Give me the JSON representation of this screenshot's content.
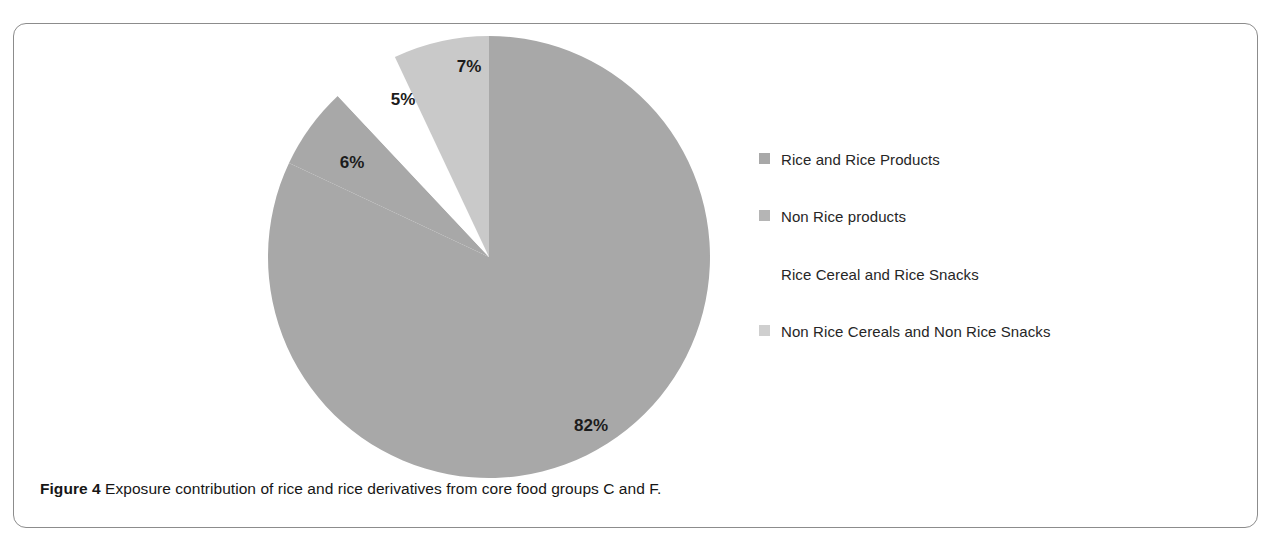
{
  "figure": {
    "caption_prefix": "Figure 4",
    "caption_text": "Exposure contribution of rice and rice derivatives from core food groups C and F."
  },
  "chart_data": {
    "type": "pie",
    "title": "",
    "categories": [
      "Rice and Rice Products",
      "Non Rice products",
      "Rice Cereal and Rice Snacks",
      "Non Rice Cereals and Non Rice Snacks"
    ],
    "values": [
      82,
      6,
      5,
      7
    ],
    "value_labels": [
      "82%",
      "6%",
      "5%",
      "7%"
    ],
    "unit": "%",
    "colors": [
      "#a8a8a8",
      "#a8a8a8",
      "#ffffff",
      "#c9c9c9"
    ],
    "start_angle_deg": 0,
    "direction": "clockwise",
    "legend_position": "right",
    "grid": false,
    "xlabel": "",
    "ylabel": ""
  },
  "legend": {
    "items": [
      {
        "label": "Rice and Rice Products",
        "color": "#a8a8a8"
      },
      {
        "label": "Non Rice products",
        "color": "#b5b5b5"
      },
      {
        "label": "Rice Cereal and Rice Snacks",
        "color": "#ffffff"
      },
      {
        "label": "Non Rice Cereals and Non Rice Snacks",
        "color": "#cfcfcf"
      }
    ]
  },
  "slice_labels": {
    "s0": "82%",
    "s1": "6%",
    "s2": "5%",
    "s3": "7%"
  }
}
